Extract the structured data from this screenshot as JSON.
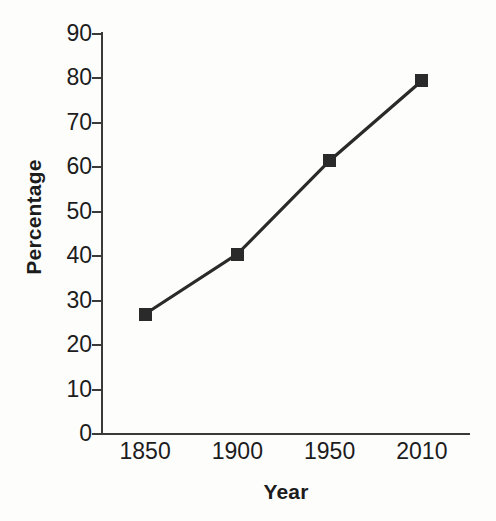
{
  "chart_data": {
    "type": "line",
    "title": "",
    "xlabel": "Year",
    "ylabel": "Percentage",
    "categories": [
      "1850",
      "1900",
      "1950",
      "2010"
    ],
    "x": [
      1850,
      1900,
      1950,
      2010
    ],
    "values": [
      27,
      40.5,
      61.5,
      79.5
    ],
    "series": [
      {
        "name": "Percentage",
        "values": [
          27,
          40.5,
          61.5,
          79.5
        ]
      }
    ],
    "ylim": [
      0,
      90
    ],
    "ytick_labels": [
      "90",
      "80",
      "70",
      "60",
      "50",
      "40",
      "30",
      "20",
      "10",
      "0"
    ],
    "ytick_values": [
      90,
      80,
      70,
      60,
      50,
      40,
      30,
      20,
      10,
      0
    ],
    "xtick_labels": [
      "1850",
      "1900",
      "1950",
      "2010"
    ],
    "grid": false,
    "legend": false,
    "marker": "square",
    "line_color": "#2a2a2a",
    "marker_color": "#2a2a2a",
    "axis_color": "#3a3a3a",
    "background_color": "#fdfdfc"
  }
}
